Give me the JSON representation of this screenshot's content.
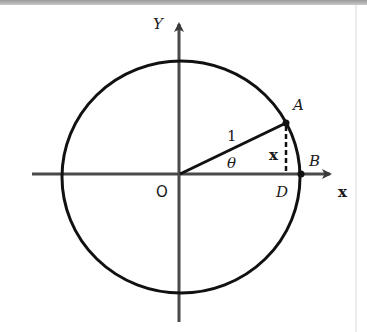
{
  "diagram": {
    "labels": {
      "y_axis": "Y",
      "x_axis": "x",
      "origin": "O",
      "point_a": "A",
      "point_b": "B",
      "point_d": "D",
      "radius": "1",
      "angle": "θ",
      "segment_ad": "x"
    },
    "colors": {
      "stroke": "#111111",
      "axis": "#3a3a3a",
      "background": "#ffffff"
    }
  }
}
